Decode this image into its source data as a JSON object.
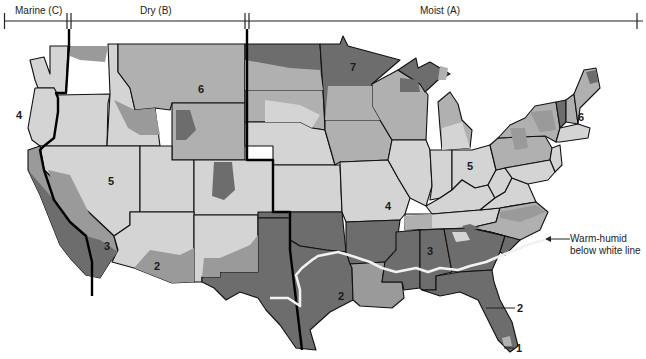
{
  "header": {
    "zones": [
      {
        "label": "Marine (C)"
      },
      {
        "label": "Dry (B)"
      },
      {
        "label": "Moist (A)"
      }
    ]
  },
  "map": {
    "description": "Climate zones of the contiguous United States",
    "zone_numbers": [
      "1",
      "2",
      "3",
      "4",
      "5",
      "6",
      "7"
    ],
    "region_labels": [
      {
        "id": "wa-or",
        "text": "4"
      },
      {
        "id": "nevada",
        "text": "5"
      },
      {
        "id": "montana",
        "text": "6"
      },
      {
        "id": "minnesota",
        "text": "7"
      },
      {
        "id": "ohio",
        "text": "5"
      },
      {
        "id": "vermont",
        "text": "6"
      },
      {
        "id": "missouri",
        "text": "4"
      },
      {
        "id": "alabama",
        "text": "3"
      },
      {
        "id": "s-california",
        "text": "3"
      },
      {
        "id": "arizona",
        "text": "2"
      },
      {
        "id": "texas",
        "text": "2"
      }
    ],
    "callouts": [
      {
        "id": "florida-2",
        "text": "2"
      },
      {
        "id": "florida-1",
        "text": "1"
      }
    ],
    "annotation": {
      "line1": "Warm-humid",
      "line2": "below white line"
    },
    "colors": {
      "zone_light": "#d4d4d4",
      "zone_medium_light": "#b0b0b0",
      "zone_medium": "#9a9a9a",
      "zone_dark": "#6d6d6d",
      "warm_humid_line": "#f2f2f2",
      "boundary": "#111111"
    }
  }
}
